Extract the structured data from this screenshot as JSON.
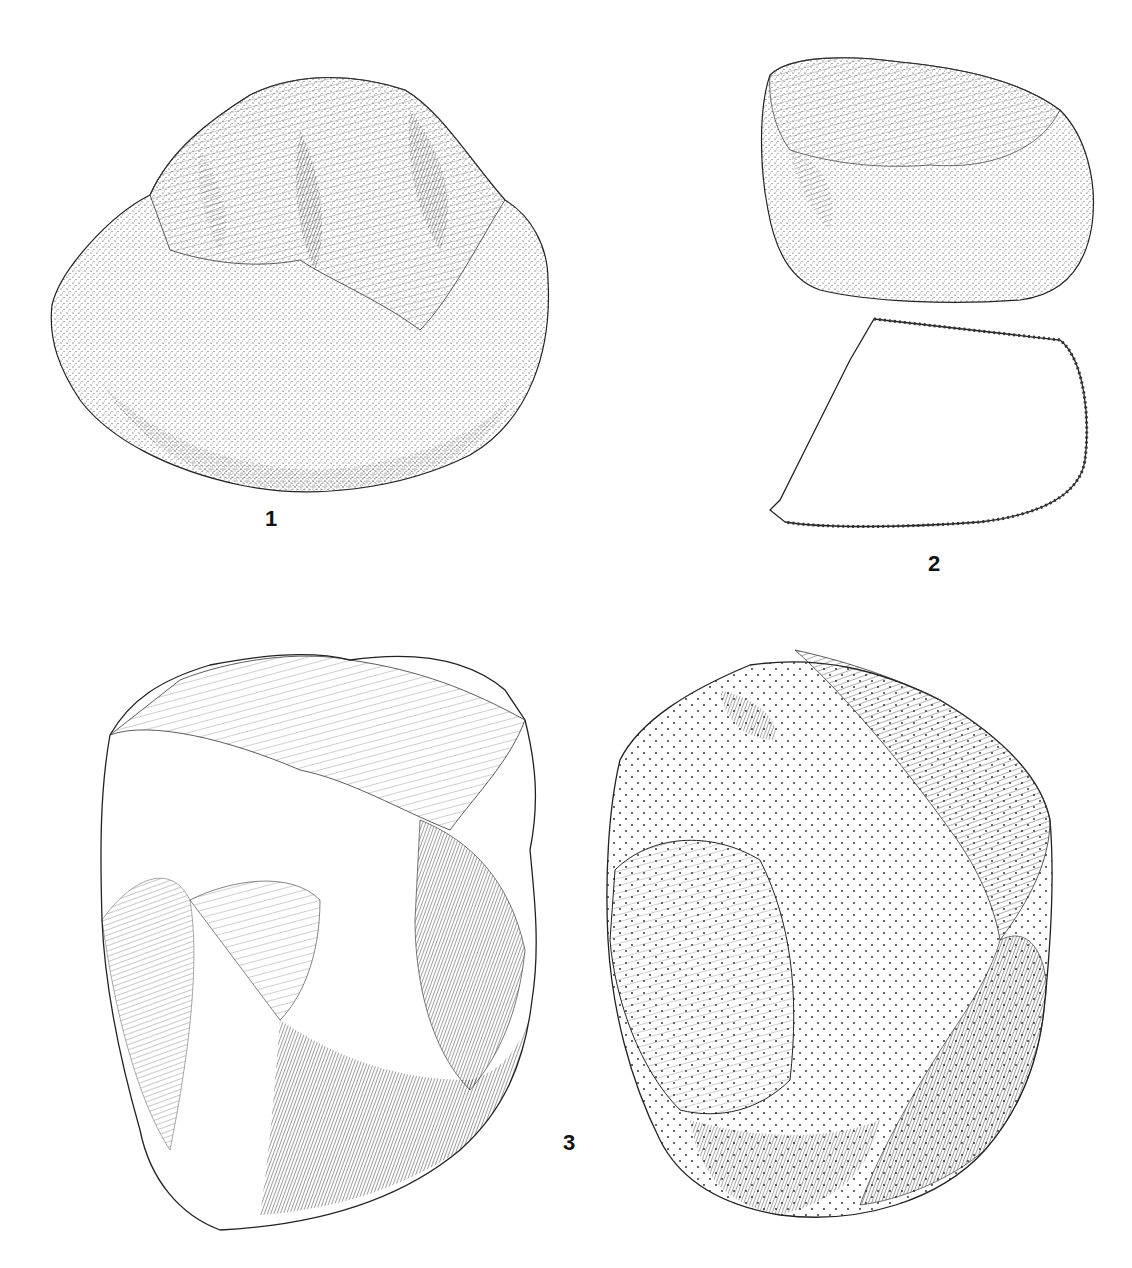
{
  "plate": {
    "background": "#ffffff",
    "ink_color": "#111111",
    "figures": [
      {
        "id": "fig-1",
        "label": "1",
        "description": "cortex-covered nodule, stippled, flaked top"
      },
      {
        "id": "fig-2",
        "label": "2",
        "description": "small flaked piece with section outline below"
      },
      {
        "id": "fig-3",
        "label": "3",
        "description": "core shown in two views"
      }
    ]
  }
}
